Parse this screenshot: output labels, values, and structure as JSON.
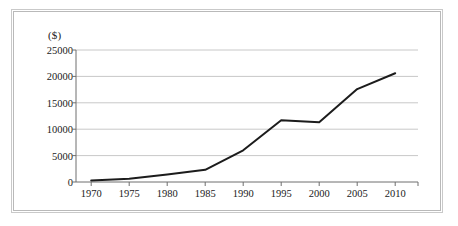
{
  "chart_data": {
    "type": "line",
    "title": "",
    "subtitle": "",
    "xlabel": "",
    "ylabel": "",
    "unit_label": "($)",
    "categories": [
      1970,
      1975,
      1980,
      1985,
      1990,
      1995,
      2000,
      2005,
      2010
    ],
    "x_tick_labels": [
      "1970",
      "1975",
      "1980",
      "1985",
      "1990",
      "1995",
      "2000",
      "2005",
      "2010"
    ],
    "y_tick_labels": [
      "0",
      "5000",
      "10000",
      "15000",
      "20000",
      "25000"
    ],
    "y_ticks": [
      0,
      5000,
      10000,
      15000,
      20000,
      25000
    ],
    "values": [
      300,
      600,
      1400,
      2300,
      6000,
      11700,
      11300,
      17600,
      20600
    ],
    "series": [
      {
        "name": "",
        "values": [
          300,
          600,
          1400,
          2300,
          6000,
          11700,
          11300,
          17600,
          20600
        ]
      }
    ],
    "xlim": [
      1968,
      2013
    ],
    "ylim": [
      0,
      25000
    ],
    "grid": "horizontal",
    "legend": "none",
    "line_color": "#1c1c1c",
    "grid_color": "#c8c8c8",
    "axis_color": "#6e6e6e",
    "frame_color": "#c9c9c9",
    "background": "#ffffff"
  }
}
